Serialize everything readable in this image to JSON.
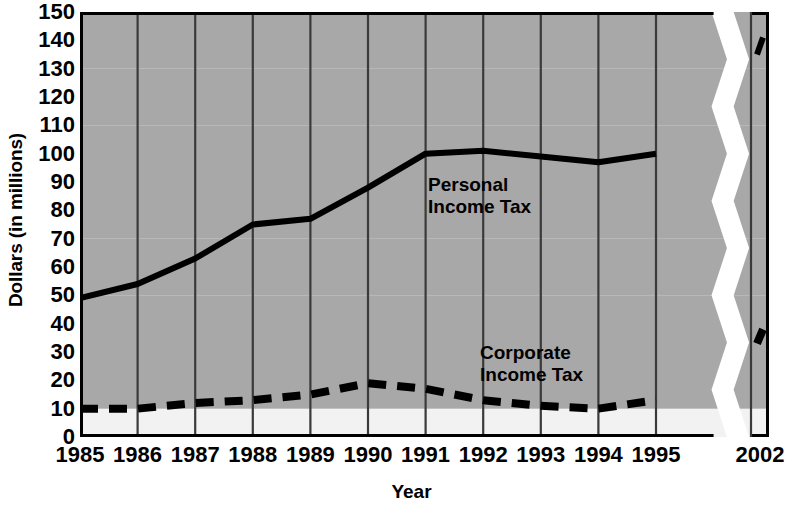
{
  "chart_data": {
    "type": "line",
    "title": "",
    "xlabel": "Year",
    "ylabel": "Dollars (in millions)",
    "categories": [
      "1985",
      "1986",
      "1987",
      "1988",
      "1989",
      "1990",
      "1991",
      "1992",
      "1993",
      "1994",
      "1995",
      "2002"
    ],
    "x_tick_labels": [
      "1985",
      "1986",
      "1987",
      "1988",
      "1989",
      "1990",
      "1991",
      "1992",
      "1993",
      "1994",
      "1995",
      "2002"
    ],
    "y_tick_labels": [
      "0",
      "10",
      "20",
      "30",
      "40",
      "50",
      "60",
      "70",
      "80",
      "90",
      "100",
      "110",
      "120",
      "130",
      "140",
      "150"
    ],
    "y_ticks": [
      0,
      10,
      20,
      30,
      40,
      50,
      60,
      70,
      80,
      90,
      100,
      110,
      120,
      130,
      140,
      150
    ],
    "ylim": [
      0,
      150
    ],
    "grid": "vertical gridlines at each year; alternating gray/white horizontal bands every 20 units",
    "axis_break": "x-axis broken between 1995 and 2002 (white zigzag band)",
    "legend_position": "inline annotations on plot",
    "series": [
      {
        "name": "Personal Income Tax",
        "style": "solid",
        "color": "#000000",
        "values": [
          49,
          54,
          63,
          75,
          77,
          88,
          100,
          101,
          99,
          97,
          100,
          null
        ],
        "break_segment": {
          "start": 135,
          "end": 141
        }
      },
      {
        "name": "Corporate Income Tax",
        "style": "dashed",
        "color": "#000000",
        "values": [
          10,
          10,
          12,
          13,
          15,
          19,
          17,
          13,
          11,
          10,
          13,
          null
        ],
        "break_segment": {
          "start": 33,
          "end": 38
        }
      }
    ],
    "annotations": [
      {
        "text": "Personal\nIncome Tax",
        "series": "Personal Income Tax"
      },
      {
        "text": "Corporate\nIncome Tax",
        "series": "Corporate Income Tax"
      }
    ]
  },
  "colors": {
    "band_gray": "#a8a8a8",
    "band_white": "#f2f2f2",
    "line": "#000000",
    "axis": "#000000",
    "gridline": "#3a3a3a",
    "background": "#ffffff"
  }
}
